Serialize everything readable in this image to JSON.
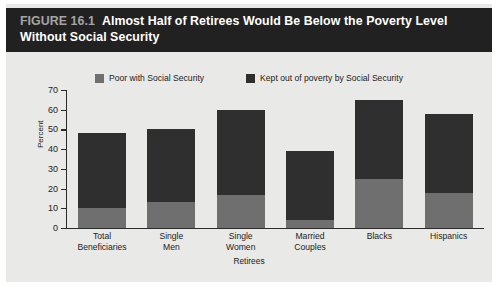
{
  "figure": {
    "number": "FIGURE 16.1",
    "title": "Almost Half of Retirees Would Be Below the Poverty Level Without Social Security"
  },
  "colors": {
    "title_bar_bg": "#212121",
    "card_bg": "#e9e9e7",
    "series_poor": "#6f6f6f",
    "series_kept_out": "#2f2f2f",
    "axis": "#2b2b2b",
    "fig_num_text": "#a5a5a5"
  },
  "chart_data": {
    "type": "bar",
    "subtype": "stacked",
    "title": "Almost Half of Retirees Would Be Below the Poverty Level Without Social Security",
    "xlabel": "Retirees",
    "ylabel": "Percent",
    "ylim": [
      0,
      70
    ],
    "yticks": [
      0,
      10,
      20,
      30,
      40,
      50,
      60,
      70
    ],
    "grid": false,
    "legend_position": "top-center",
    "categories": [
      "Total Beneficiaries",
      "Single Men",
      "Single Women",
      "Married Couples",
      "Blacks",
      "Hispanics"
    ],
    "category_lines": [
      [
        "Total",
        "Beneficiaries"
      ],
      [
        "Single",
        "Men"
      ],
      [
        "Single",
        "Women"
      ],
      [
        "Married",
        "Couples"
      ],
      [
        "Blacks",
        ""
      ],
      [
        "Hispanics",
        ""
      ]
    ],
    "series": [
      {
        "name": "Poor with Social Security",
        "color": "#6f6f6f",
        "values": [
          10,
          13,
          17,
          4,
          25,
          18
        ]
      },
      {
        "name": "Kept out of poverty by Social Security",
        "color": "#2f2f2f",
        "values": [
          38,
          37,
          43,
          35,
          40,
          40
        ]
      }
    ],
    "totals": [
      48,
      50,
      60,
      39,
      65,
      58
    ]
  },
  "legend": [
    {
      "label": "Poor with Social Security",
      "color": "#6f6f6f"
    },
    {
      "label": "Kept out of poverty by Social Security",
      "color": "#2f2f2f"
    }
  ],
  "yticks": [
    {
      "label": "70"
    },
    {
      "label": "60"
    },
    {
      "label": "50"
    },
    {
      "label": "40"
    },
    {
      "label": "30"
    },
    {
      "label": "20"
    },
    {
      "label": "10"
    },
    {
      "label": "0"
    }
  ]
}
